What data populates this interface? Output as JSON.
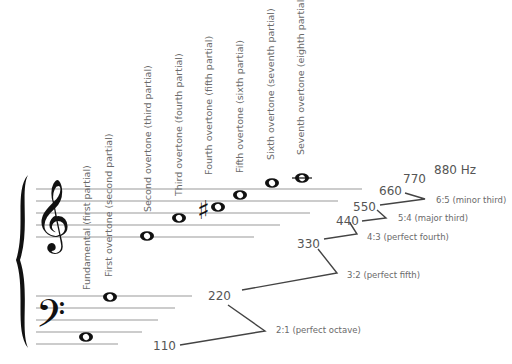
{
  "partials": [
    {
      "label": "Fundamental (first partial)",
      "freq": "110"
    },
    {
      "label": "First overtone (second partial)",
      "freq": "220"
    },
    {
      "label": "Second overtone (third partial)",
      "freq": "330"
    },
    {
      "label": "Third overtone (fourth partial)",
      "freq": "440"
    },
    {
      "label": "Fourth overtone (fifth partial)",
      "freq": "550"
    },
    {
      "label": "Fifth overtone (sixth partial)",
      "freq": "660"
    },
    {
      "label": "Sixth overtone (seventh partial)",
      "freq": "770"
    },
    {
      "label": "Seventh overtone (eighth partial)",
      "freq": "880 Hz"
    }
  ],
  "intervals": [
    {
      "ratio": "2:1 (perfect octave)"
    },
    {
      "ratio": "3:2 (perfect fifth)"
    },
    {
      "ratio": "4:3 (perfect fourth)"
    },
    {
      "ratio": "5:4 (major third)"
    },
    {
      "ratio": "6:5 (minor third)"
    }
  ],
  "icons": {
    "treble_clef": "𝄞",
    "bass_clef": "𝄢",
    "sharp": "♯"
  }
}
